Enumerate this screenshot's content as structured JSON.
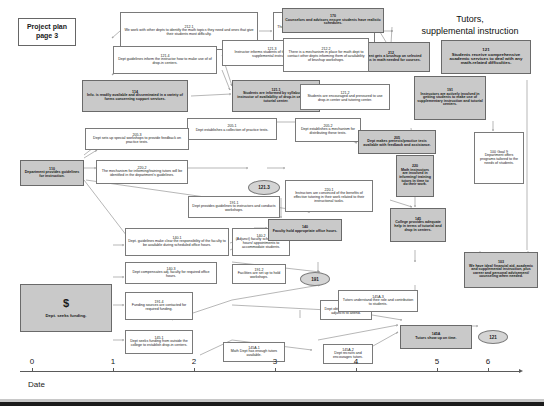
{
  "title_card": {
    "line1": "Project plan",
    "line2": "page 3"
  },
  "banner": {
    "line1": "Tutors,",
    "line2": "supplemental instruction"
  },
  "axis": {
    "name": "Date",
    "ticks": [
      "0",
      "1",
      "2",
      "3",
      "4",
      "5",
      "6"
    ]
  },
  "money_node": {
    "symbol": "$",
    "text": "Dept. seeks funding."
  },
  "ellipses": [
    {
      "id": "e1",
      "label": "121.3"
    },
    {
      "id": "e2",
      "label": "191"
    },
    {
      "id": "e3",
      "label": "121"
    }
  ],
  "nodes": [
    {
      "id": "n212_1",
      "num": "212.1",
      "text": "We work with other depts to identify the math topics they need and ones that give their students most difficulty.",
      "style": "plain"
    },
    {
      "id": "n212_3",
      "num": "212.3",
      "text": "The math dept creates a manual of math topics needed for brushup.",
      "style": "plain"
    },
    {
      "id": "n170",
      "num": "170",
      "text": "Counselors and advisors ensure students have realistic schedules.",
      "style": "shaded"
    },
    {
      "id": "n212",
      "num": "212",
      "text": "Student gets a brushup on selected topics in math needed for courses.",
      "style": "shaded"
    },
    {
      "id": "n121",
      "num": "121",
      "text": "Students receive comprehensive academic services to deal with any math-related difficulties.",
      "style": "shaded"
    },
    {
      "id": "n121_4",
      "num": "121.4",
      "text": "Dept guidelines inform the instructor how to make use of of drop-in centers.",
      "style": "plain"
    },
    {
      "id": "n121_3b",
      "num": "121.3",
      "text": "Instructor informs students of the importance of supplemental instruction.",
      "style": "plain"
    },
    {
      "id": "n212_2",
      "num": "212.2",
      "text": "There is a mechanism in place for math dept to contact other depts informing them of availability of brushup workshops.",
      "style": "plain"
    },
    {
      "id": "n114",
      "num": "114",
      "text": "Info. is readily available and disseminated in a variety of forms concerning support services.",
      "style": "shaded"
    },
    {
      "id": "n121_1",
      "num": "121.1",
      "text": "Students are informed by syllabus and instructor of availability of drop-in center and tutorial center.",
      "style": "shaded"
    },
    {
      "id": "n121_2",
      "num": "121.2",
      "text": "Students are encouraged and pressured to use drop-in center and tutoring center.",
      "style": "plain"
    },
    {
      "id": "n191",
      "num": "191",
      "text": "Instructors are actively involved in getting students to make use of supplementary instruction and tutorial centers.",
      "style": "shaded"
    },
    {
      "id": "n205_1",
      "num": "205.1",
      "text": "Dept establishes a collection of practice tests.",
      "style": "plain"
    },
    {
      "id": "n205_2",
      "num": "205.2",
      "text": "Dept establishes a mechanism for distributing these tests.",
      "style": "plain"
    },
    {
      "id": "n205_3",
      "num": "205.3",
      "text": "Dept sets up special workshops to provide feedback on practice tests.",
      "style": "plain"
    },
    {
      "id": "n205",
      "num": "205",
      "text": "Dept makes pretests/practice tests available with feedback and assistance.",
      "style": "shaded"
    },
    {
      "id": "n100",
      "num": "100 Goal 9",
      "text": "Department offers programs tailored to the needs of students.",
      "style": "plain"
    },
    {
      "id": "n110",
      "num": "110",
      "text": "Department provides guidelines for instruction.",
      "style": "shaded"
    },
    {
      "id": "n220_2",
      "num": "220.2",
      "text": "The mechanism for informing/training tutors will be identified in the department's guidelines.",
      "style": "plain"
    },
    {
      "id": "n220_1",
      "num": "220.1",
      "text": "Instructors are convinced of the benefits of effective tutoring in their work related to their instructional tasks.",
      "style": "plain"
    },
    {
      "id": "n220",
      "num": "220",
      "text": "Math instructors are involved in informing/ training tutors in time to do their work.",
      "style": "shaded"
    },
    {
      "id": "n191_1",
      "num": "191.1",
      "text": "Dept provides guidelines to instructors and conducts workshops.",
      "style": "plain"
    },
    {
      "id": "n140_1",
      "num": "140.1",
      "text": "Dept. guidelines make clear the responsibility of the faculty to be available during scheduled office hours.",
      "style": "plain"
    },
    {
      "id": "n140_2",
      "num": "140.2",
      "text": "(Adjunct) faculty schedule office hours/ appointments to accommodate students.",
      "style": "plain"
    },
    {
      "id": "n140",
      "num": "140",
      "text": "Faculty hold appropriate office hours.",
      "style": "shaded"
    },
    {
      "id": "n145",
      "num": "145",
      "text": "College provides adequate help in terms of tutorial and drop in centers.",
      "style": "shaded"
    },
    {
      "id": "n103",
      "num": "103",
      "text": "We have ideal financial aid, academic and supplemental instruction, plus career and personal advisement/ counseling when needed.",
      "style": "shaded"
    },
    {
      "id": "n140_3",
      "num": "140.3",
      "text": "Dept compensates adj. faculty for required office hours.",
      "style": "plain"
    },
    {
      "id": "n191_4",
      "num": "191.4",
      "text": "Funding sources are contacted for required funding.",
      "style": "plain"
    },
    {
      "id": "n191_2",
      "num": "191.2",
      "text": "Facilities are set up to hold workshops.",
      "style": "plain"
    },
    {
      "id": "n191_3",
      "num": "191.3",
      "text": "Dept obtains money to pay adjuncts to attend.",
      "style": "plain"
    },
    {
      "id": "n145_1",
      "num": "145.1",
      "text": "Dept seeks funding from outside the college to establish drop-in centers.",
      "style": "plain"
    },
    {
      "id": "n145A_1",
      "num": "145A.1",
      "text": "Math Dept has enough tutors available.",
      "style": "plain"
    },
    {
      "id": "n145A_2",
      "num": "145A.2",
      "text": "Dept recruits and encourages tutors.",
      "style": "plain"
    },
    {
      "id": "n145A_3",
      "num": "145A.3",
      "text": "Tutors understand their role and contribution to students.",
      "style": "plain"
    },
    {
      "id": "n145A",
      "num": "145A",
      "text": "Tutors show up on time.",
      "style": "shaded"
    }
  ]
}
